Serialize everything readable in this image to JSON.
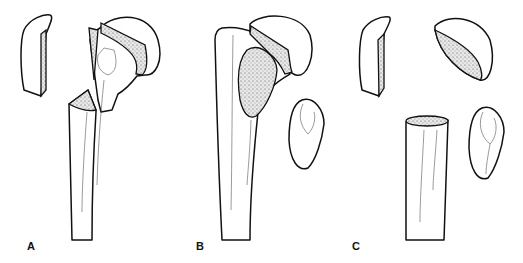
{
  "figure": {
    "panels": [
      {
        "label": "A",
        "fragments": [
          "greater tuberosity",
          "humeral head with shaft",
          "shaft"
        ]
      },
      {
        "label": "B",
        "fragments": [
          "shaft with greater tuberosity",
          "humeral head",
          "lesser tuberosity"
        ]
      },
      {
        "label": "C",
        "fragments": [
          "greater tuberosity",
          "humeral head",
          "lesser tuberosity",
          "shaft"
        ]
      }
    ],
    "colors": {
      "line": "#111111",
      "background": "#ffffff",
      "stipple": "#333333"
    }
  }
}
